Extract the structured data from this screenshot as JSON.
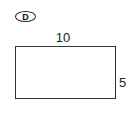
{
  "figure": {
    "label": "D",
    "shape": "rectangle",
    "width_label": "10",
    "height_label": "5"
  }
}
